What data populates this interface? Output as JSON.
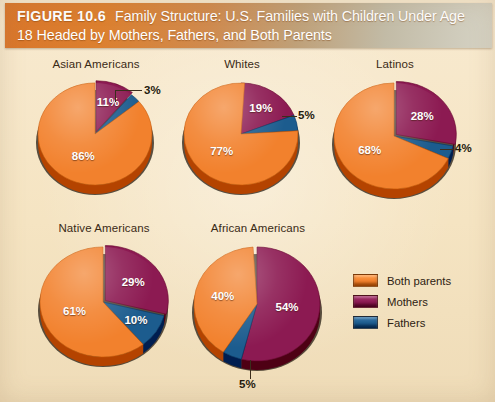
{
  "banner": {
    "figure_number": "FIGURE 10.6",
    "title_line1": "Family Structure: U.S. Families with Children Under Age",
    "title_line2": "18 Headed by Mothers, Fathers, and Both Parents"
  },
  "colors": {
    "both_parents": "#F2812D",
    "mothers": "#8C1A52",
    "fathers": "#1C5C8E",
    "background": "#F5E4C2",
    "banner_start": "#D9762B",
    "banner_end": "#D6D3C4",
    "label_text": "#FFFFFF",
    "title_text": "#3A2A16"
  },
  "legend": {
    "items": [
      {
        "label": "Both parents",
        "color": "#F2812D",
        "key": "both_parents"
      },
      {
        "label": "Mothers",
        "color": "#8C1A52",
        "key": "mothers"
      },
      {
        "label": "Fathers",
        "color": "#1C5C8E",
        "key": "fathers"
      }
    ]
  },
  "chart_data": {
    "type": "pie",
    "title": "Family Structure: U.S. Families with Children Under Age 18 Headed by Mothers, Fathers, and Both Parents",
    "legend_position": "right",
    "categories": [
      "Both parents",
      "Mothers",
      "Fathers"
    ],
    "unit": "%",
    "charts": [
      {
        "title": "Asian Americans",
        "slices": [
          {
            "category": "Mothers",
            "value": 11,
            "label": "11%",
            "placement": "inside"
          },
          {
            "category": "Fathers",
            "value": 3,
            "label": "3%",
            "placement": "outside"
          },
          {
            "category": "Both parents",
            "value": 86,
            "label": "86%",
            "placement": "inside"
          }
        ]
      },
      {
        "title": "Whites",
        "slices": [
          {
            "category": "Mothers",
            "value": 19,
            "label": "19%",
            "placement": "inside"
          },
          {
            "category": "Fathers",
            "value": 5,
            "label": "5%",
            "placement": "outside"
          },
          {
            "category": "Both parents",
            "value": 77,
            "label": "77%",
            "placement": "inside"
          }
        ]
      },
      {
        "title": "Latinos",
        "slices": [
          {
            "category": "Mothers",
            "value": 28,
            "label": "28%",
            "placement": "inside"
          },
          {
            "category": "Fathers",
            "value": 4,
            "label": "4%",
            "placement": "outside"
          },
          {
            "category": "Both parents",
            "value": 68,
            "label": "68%",
            "placement": "inside"
          }
        ]
      },
      {
        "title": "Native Americans",
        "slices": [
          {
            "category": "Mothers",
            "value": 29,
            "label": "29%",
            "placement": "inside"
          },
          {
            "category": "Fathers",
            "value": 10,
            "label": "10%",
            "placement": "inside"
          },
          {
            "category": "Both parents",
            "value": 61,
            "label": "61%",
            "placement": "inside"
          }
        ]
      },
      {
        "title": "African Americans",
        "slices": [
          {
            "category": "Mothers",
            "value": 54,
            "label": "54%",
            "placement": "inside"
          },
          {
            "category": "Fathers",
            "value": 5,
            "label": "5%",
            "placement": "outside"
          },
          {
            "category": "Both parents",
            "value": 40,
            "label": "40%",
            "placement": "inside"
          }
        ]
      }
    ]
  },
  "layout": {
    "pies": [
      {
        "key": "asian",
        "left": 22,
        "top": 58,
        "width": 148,
        "stage_top": 20,
        "r": 57,
        "ry": 51,
        "explode_mothers": true
      },
      {
        "key": "whites",
        "left": 172,
        "top": 58,
        "width": 140,
        "stage_top": 20,
        "r": 57,
        "ry": 51,
        "explode_mothers": false
      },
      {
        "key": "latinos",
        "left": 320,
        "top": 58,
        "width": 150,
        "stage_top": 20,
        "r": 60,
        "ry": 53,
        "explode_mothers": true
      },
      {
        "key": "native",
        "left": 24,
        "top": 222,
        "width": 160,
        "stage_top": 20,
        "r": 63,
        "ry": 55,
        "explode_mothers": true
      },
      {
        "key": "african",
        "left": 178,
        "top": 222,
        "width": 160,
        "stage_top": 20,
        "r": 63,
        "ry": 57,
        "explode_mothers": false
      }
    ]
  }
}
